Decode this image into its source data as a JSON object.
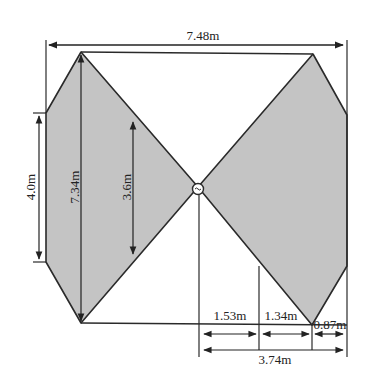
{
  "diagram": {
    "type": "engineering-dimension-drawing",
    "fill_color": "#c4c4c4",
    "stroke_color": "#2a2a2a",
    "background": "#ffffff",
    "center_node": "pivot-circle",
    "dimensions": {
      "total_width": "7.48m",
      "total_height": "7.34m",
      "side_height": "4.0m",
      "inner_height": "3.6m",
      "seg_1": "1.53m",
      "seg_2": "1.34m",
      "seg_3": "0.87m",
      "half_width": "3.74m"
    }
  }
}
